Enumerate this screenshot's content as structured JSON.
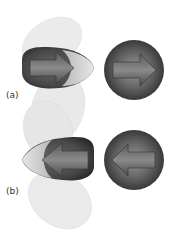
{
  "figure": {
    "panels": [
      {
        "label": "(a)",
        "arrow_direction": "right"
      },
      {
        "label": "(b)",
        "arrow_direction": "left"
      }
    ],
    "colors": {
      "lobe_light": "#d4d4d4",
      "lobe_dark": "#4a4a4a",
      "sphere_dark": "#3c3c3c",
      "arrow": "#6e6e6e"
    }
  }
}
